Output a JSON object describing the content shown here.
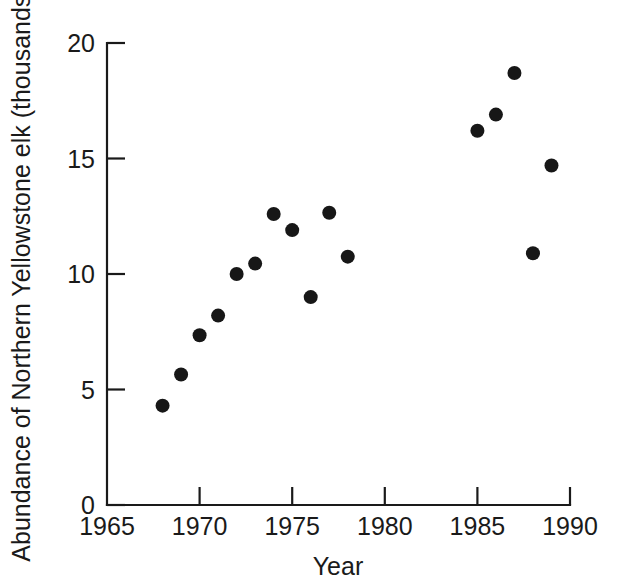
{
  "chart_data": {
    "type": "scatter",
    "title": "",
    "xlabel": "Year",
    "ylabel": "Abundance of Northern Yellowstone elk (thousands)",
    "xlim": [
      1965,
      1990
    ],
    "ylim": [
      0,
      20
    ],
    "xticks": [
      1965,
      1970,
      1975,
      1980,
      1985,
      1990
    ],
    "xtick_labels": [
      "1965",
      "1970",
      "1975",
      "1980",
      "1985",
      "1990"
    ],
    "yticks": [
      0,
      5,
      10,
      15,
      20
    ],
    "ytick_labels": [
      "0",
      "5",
      "10",
      "15",
      "20"
    ],
    "grid": false,
    "legend": null,
    "marker": "filled-circle",
    "marker_color": "#171717",
    "x": [
      1968,
      1969,
      1970,
      1971,
      1972,
      1973,
      1974,
      1975,
      1976,
      1977,
      1978,
      1985,
      1986,
      1987,
      1988,
      1989
    ],
    "y": [
      4.3,
      5.65,
      7.35,
      8.2,
      10.0,
      10.45,
      12.6,
      11.9,
      9.0,
      12.65,
      10.75,
      16.2,
      16.9,
      18.7,
      10.9,
      14.7
    ],
    "points": [
      {
        "x": 1968,
        "y": 4.3
      },
      {
        "x": 1969,
        "y": 5.65
      },
      {
        "x": 1970,
        "y": 7.35
      },
      {
        "x": 1971,
        "y": 8.2
      },
      {
        "x": 1972,
        "y": 10.0
      },
      {
        "x": 1973,
        "y": 10.45
      },
      {
        "x": 1974,
        "y": 12.6
      },
      {
        "x": 1975,
        "y": 11.9
      },
      {
        "x": 1976,
        "y": 9.0
      },
      {
        "x": 1977,
        "y": 12.65
      },
      {
        "x": 1978,
        "y": 10.75
      },
      {
        "x": 1985,
        "y": 16.2
      },
      {
        "x": 1986,
        "y": 16.9
      },
      {
        "x": 1987,
        "y": 18.7
      },
      {
        "x": 1988,
        "y": 10.9
      },
      {
        "x": 1989,
        "y": 14.7
      }
    ]
  },
  "axes": {
    "x_title": "Year",
    "y_title": "Abundance of Northern Yellowstone elk (thousands)"
  }
}
